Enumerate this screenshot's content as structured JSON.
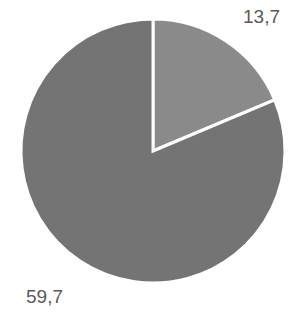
{
  "chart_data": {
    "type": "pie",
    "title": "",
    "values": [
      13.7,
      59.7
    ],
    "labels": [
      "13,7",
      "59,7"
    ],
    "colors": [
      "#8a8a8a",
      "#747474"
    ],
    "start_angle_deg": 0,
    "direction": "clockwise",
    "legend": "none",
    "slice_border_color": "#ffffff"
  }
}
